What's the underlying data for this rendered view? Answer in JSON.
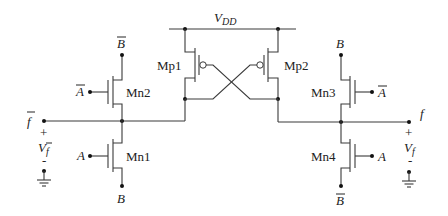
{
  "diagram": {
    "type": "circuit-schematic",
    "supply": {
      "label_main": "V",
      "label_sub": "DD"
    },
    "transistors": [
      {
        "id": "Mp1",
        "label": "Mp1",
        "type": "pmos"
      },
      {
        "id": "Mp2",
        "label": "Mp2",
        "type": "pmos"
      },
      {
        "id": "Mn1",
        "label": "Mn1",
        "type": "nmos",
        "gate": "A",
        "source": "B"
      },
      {
        "id": "Mn2",
        "label": "Mn2",
        "type": "nmos",
        "gate": "A-bar",
        "source": "B-bar"
      },
      {
        "id": "Mn3",
        "label": "Mn3",
        "type": "nmos",
        "gate": "A-bar",
        "source": "B"
      },
      {
        "id": "Mn4",
        "label": "Mn4",
        "type": "nmos",
        "gate": "A",
        "source": "B-bar"
      }
    ],
    "labels": {
      "mn2_top": "B",
      "mn2_gate": "A",
      "mn1_gate": "A",
      "mn1_bottom": "B",
      "mn3_top": "B",
      "mn3_gate": "A",
      "mn4_gate": "A",
      "mn4_bottom": "B",
      "out_left": "f",
      "out_right": "f",
      "plus": "+",
      "minus": "-",
      "v_left_main": "V",
      "v_left_sub": "f",
      "v_right_main": "V",
      "v_right_sub": "f"
    }
  }
}
